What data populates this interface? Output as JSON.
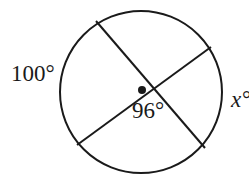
{
  "diagram": {
    "type": "circle-with-intersecting-chords",
    "labels": {
      "arc_left": "100°",
      "angle_center": "96°",
      "arc_right": "x°"
    },
    "colors": {
      "stroke": "#1a1a1a",
      "background": "#ffffff"
    }
  }
}
